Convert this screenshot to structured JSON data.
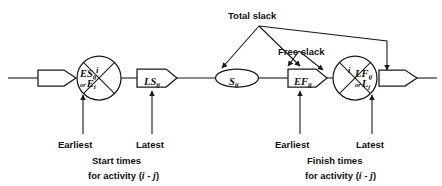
{
  "diagram": {
    "type": "activity-on-arrow-network",
    "title_labels": {
      "total_slack": "Total slack",
      "free_slack": "Free slack"
    },
    "nodes": {
      "start_event": {
        "name": "start-event-circle",
        "top_index": "i",
        "left_value_main": "ES",
        "left_value_sub": "ij",
        "left_value_or": "or",
        "left_value_alt_main": "E",
        "left_value_alt_sub": "i"
      },
      "finish_event": {
        "name": "finish-event-circle",
        "top_index": "i",
        "right_value_main": "LF",
        "right_value_sub": "ij",
        "right_value_or": "or",
        "right_value_alt_main": "L",
        "right_value_alt_sub": "j"
      }
    },
    "boxes": [
      {
        "id": "ls-box",
        "main": "LS",
        "sub": "ij"
      },
      {
        "id": "s-box",
        "main": "S",
        "sub": "ij"
      },
      {
        "id": "ef-box",
        "main": "EF",
        "sub": "ij"
      }
    ],
    "captions": {
      "left": {
        "earliest": "Earliest",
        "latest": "Latest",
        "line1": "Start times",
        "line2_prefix": "for activity (",
        "line2_i": "i",
        "line2_dash": " - ",
        "line2_j": "j",
        "line2_suffix": ")"
      },
      "right": {
        "earliest": "Earliest",
        "latest": "Latest",
        "line1": "Finish times",
        "line2_prefix": "for activity (",
        "line2_i": "i",
        "line2_dash": " - ",
        "line2_j": "j",
        "line2_suffix": ")"
      }
    },
    "colors": {
      "stroke": "#1a1a1a",
      "background": "#ffffff"
    }
  }
}
